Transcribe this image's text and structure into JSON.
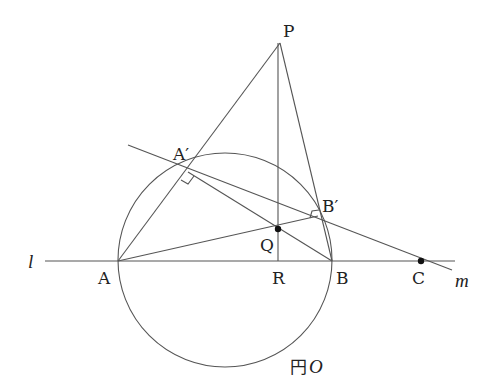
{
  "diagram": {
    "type": "geometry-figure",
    "labels": {
      "P": "P",
      "A_prime": "A′",
      "B_prime": "B′",
      "Q": "Q",
      "A": "A",
      "R": "R",
      "B": "B",
      "C": "C",
      "line_l": "l",
      "line_m": "m",
      "circle_prefix": "円",
      "circle_name": "O"
    },
    "points": {
      "P": [
        280,
        43
      ],
      "A": [
        118,
        261
      ],
      "B": [
        332,
        261
      ],
      "R": [
        278,
        261
      ],
      "Q": [
        278,
        228
      ],
      "C": [
        421,
        261
      ],
      "A_prime": [
        188,
        172
      ],
      "B_prime": [
        318,
        216
      ]
    },
    "circle": {
      "cx": 225,
      "cy": 260,
      "r": 107
    },
    "colors": {
      "line": "#555555",
      "text": "#222222",
      "background": "#ffffff"
    }
  }
}
